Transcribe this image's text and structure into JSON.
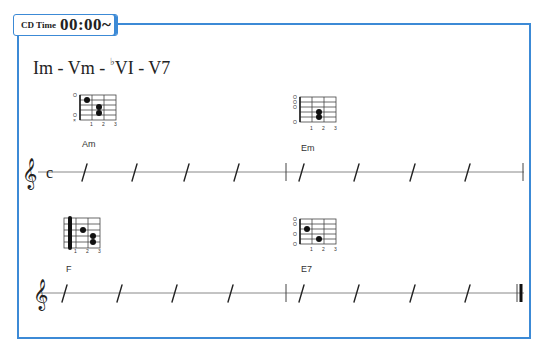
{
  "header": {
    "badge_label": "CD Time",
    "time": "00:00~"
  },
  "progression": {
    "part1": "Im - Vm - ",
    "flat": "♭",
    "part2": "VI - V7"
  },
  "rows": [
    {
      "time_signature": "c",
      "chords": [
        {
          "name": "Am",
          "markers": [
            "O",
            "",
            "",
            "",
            "O",
            "×"
          ]
        },
        {
          "name": "Em",
          "markers": [
            "O",
            "O",
            "O",
            "",
            "",
            "O"
          ]
        }
      ]
    },
    {
      "time_signature": "",
      "chords": [
        {
          "name": "F",
          "markers": [
            "",
            "",
            "",
            "",
            "",
            ""
          ]
        },
        {
          "name": "E7",
          "markers": [
            "O",
            "O",
            "",
            "O",
            "",
            "O"
          ]
        }
      ]
    }
  ],
  "fret_numbers": [
    "1",
    "2",
    "3"
  ],
  "colors": {
    "frame": "#3c8ad6",
    "ink": "#222222"
  }
}
